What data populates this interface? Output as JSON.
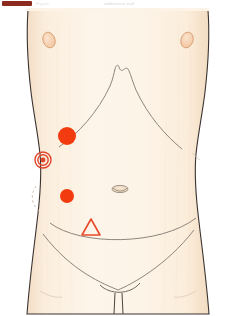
{
  "header": {
    "bar_color": "#8c2a20",
    "caption_left": "Figure",
    "caption_right": "abdominal wall"
  },
  "figure": {
    "name": "abdomen-anatomy-diagram",
    "colors": {
      "skin_light": "#fdf3e7",
      "skin_mid": "#fae8d5",
      "skin_shadow": "#f5dcc4",
      "outline": "#3a3330",
      "soft_line": "#9a8f86",
      "marker_red": "#f23c10",
      "ring_red": "#e0452a",
      "nipple_fill": "#f6d3b4",
      "nipple_edge": "#d9a074",
      "background": "#ffffff"
    },
    "landmarks": [
      {
        "name": "nipple-left",
        "cx": 49,
        "cy": 32,
        "rx": 6,
        "ry": 8
      },
      {
        "name": "nipple-right",
        "cx": 187,
        "cy": 32,
        "rx": 6,
        "ry": 8
      },
      {
        "name": "umbilicus",
        "cx": 120,
        "cy": 181,
        "rx": 8,
        "ry": 3.5
      }
    ],
    "markers": [
      {
        "name": "marker-filled-upper",
        "shape": "filled-circle",
        "cx": 67,
        "cy": 128,
        "r": 9
      },
      {
        "name": "marker-bullseye",
        "shape": "concentric-rings",
        "cx": 43,
        "cy": 152,
        "r": 8
      },
      {
        "name": "marker-filled-lower",
        "shape": "filled-circle",
        "cx": 67,
        "cy": 188,
        "r": 7
      },
      {
        "name": "marker-triangle",
        "shape": "open-triangle",
        "cx": 91,
        "cy": 221,
        "size": 11
      }
    ],
    "annotations": {
      "dashed_arc": "dashed-region-left-lower",
      "costal_margin": "rib-cage-costal-margin",
      "inguinal_lines": "inguinal-fold-curves"
    }
  }
}
